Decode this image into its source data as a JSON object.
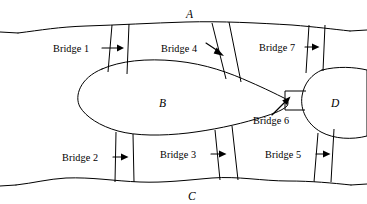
{
  "figure": {
    "type": "diagram",
    "stroke_color": "#000000",
    "background_color": "#ffffff",
    "land_fill": "#ffffff"
  },
  "regions": [
    {
      "id": "A",
      "label": "A",
      "role": "north-bank",
      "label_x": 188,
      "label_y": 16
    },
    {
      "id": "B",
      "label": "B",
      "role": "central-island",
      "label_x": 161,
      "label_y": 103
    },
    {
      "id": "C",
      "label": "C",
      "role": "south-bank",
      "label_x": 190,
      "label_y": 196
    },
    {
      "id": "D",
      "label": "D",
      "role": "east-island",
      "label_x": 332,
      "label_y": 103
    }
  ],
  "bridges": [
    {
      "id": 1,
      "label": "Bridge 1",
      "connects": [
        "B",
        "A"
      ],
      "label_x": 53,
      "label_y": 49,
      "arrow_x1": 103,
      "arrow_y1": 48,
      "arrow_x2": 119,
      "arrow_y2": 48
    },
    {
      "id": 2,
      "label": "Bridge 2",
      "connects": [
        "B",
        "C"
      ],
      "label_x": 74,
      "label_y": 158,
      "arrow_x1": 116,
      "arrow_y1": 157,
      "arrow_x2": 132,
      "arrow_y2": 157
    },
    {
      "id": 3,
      "label": "Bridge 3",
      "connects": [
        "B",
        "C"
      ],
      "label_x": 173,
      "label_y": 155,
      "arrow_x1": 215,
      "arrow_y1": 154,
      "arrow_x2": 231,
      "arrow_y2": 154
    },
    {
      "id": 4,
      "label": "Bridge 4",
      "connects": [
        "B",
        "A"
      ],
      "label_x": 163,
      "label_y": 48,
      "arrow_x1": 206,
      "arrow_y1": 44,
      "arrow_x2": 220,
      "arrow_y2": 53
    },
    {
      "id": 5,
      "label": "Bridge 5",
      "connects": [
        "D",
        "C"
      ],
      "label_x": 277,
      "label_y": 155,
      "arrow_x1": 320,
      "arrow_y1": 154,
      "arrow_x2": 336,
      "arrow_y2": 154
    },
    {
      "id": 6,
      "label": "Bridge 6",
      "connects": [
        "B",
        "D"
      ],
      "label_x": 256,
      "label_y": 120,
      "arrow_x1": 277,
      "arrow_y1": 114,
      "arrow_x2": 290,
      "arrow_y2": 100
    },
    {
      "id": 7,
      "label": "Bridge 7",
      "connects": [
        "D",
        "A"
      ],
      "label_x": 266,
      "label_y": 48,
      "arrow_x1": 310,
      "arrow_y1": 47,
      "arrow_x2": 326,
      "arrow_y2": 47
    }
  ],
  "geometry": {
    "north_bank_edge": "M 18,33 C 42,30 58,27 86,26 C 118,25 152,23 186,22 C 222,21 258,23 292,25 C 316,27 332,29 350,31",
    "south_bank_edge": "M 16,185 C 34,183 48,179 66,178 C 92,177 114,181 140,182 C 164,183 188,180 212,178 C 238,176 262,181 288,181 C 312,181 332,183 351,185",
    "island_b": "M 102,69 C 120,61 146,58 176,61 C 206,64 230,73 250,82 C 266,89 276,94 284,98 C 288,100 289,103 287,106 C 282,111 270,115 256,119 C 236,125 212,130 188,133 C 162,136 136,136 118,131 C 100,126 86,117 80,107 C 74,96 80,78 102,69 Z",
    "island_d": "M 318,72 C 332,68 346,68 358,71 L 367,73 L 367,134 L 356,137 C 342,140 326,138 314,131 C 302,123 297,109 300,96 C 302,85 308,76 318,72 Z",
    "bridge_rails": [
      "M 113,25 L 110,73",
      "M 129,24 L 127,74",
      "M 116,131 L 115,182",
      "M 132,132 L 133,182",
      "M 213,23 L 226,78",
      "M 229,22 L 240,81",
      "M 215,130 L 219,180",
      "M 231,127 L 236,180",
      "M 309,25 L 306,73",
      "M 324,25 L 322,73",
      "M 318,133 L 315,182",
      "M 333,130 L 331,182",
      "M 262,90 L 305,90",
      "M 262,110 L 305,110"
    ],
    "b_neck": "M 262,90 L 262,110",
    "d_inlet_upper": "M 300,96 C 298,93 299,91 305,90",
    "d_inlet_lower": "M 300,105 C 298,108 299,110 305,110"
  }
}
